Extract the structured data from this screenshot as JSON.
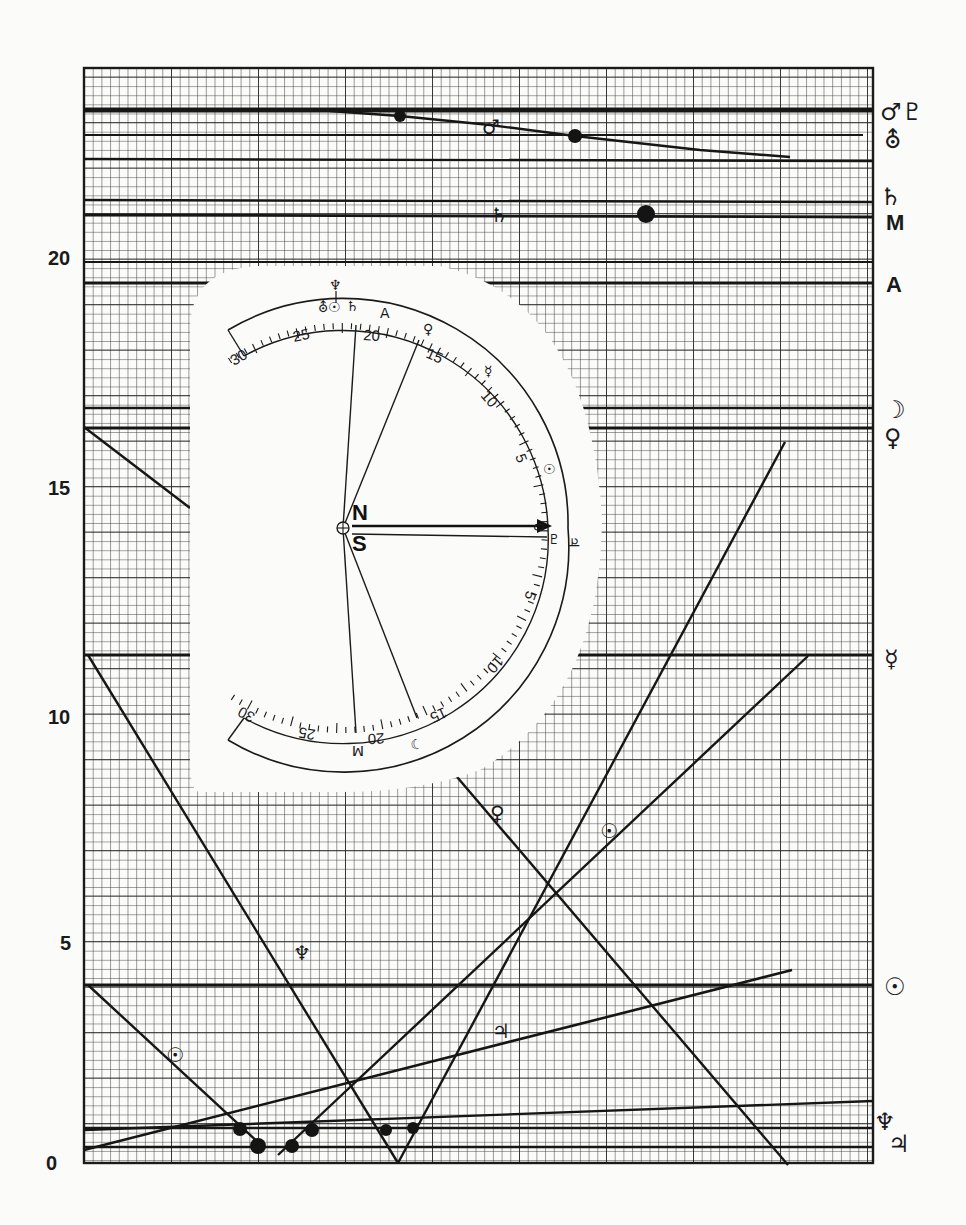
{
  "figure": {
    "colors": {
      "paper": "#fbfbfa",
      "ink": "#1a1a1a",
      "grid_minor": "#3a3a3a",
      "grid_major": "#1f1f1f"
    }
  },
  "y_axis": {
    "ticks": [
      {
        "value": 0,
        "label": "0"
      },
      {
        "value": 5,
        "label": "5"
      },
      {
        "value": 10,
        "label": "10"
      },
      {
        "value": 15,
        "label": "15"
      },
      {
        "value": 20,
        "label": "20"
      }
    ],
    "range": [
      0,
      24.2
    ]
  },
  "right_labels": [
    {
      "name": "mars-pluto-label",
      "text": "♂♇",
      "y_value": 23.3
    },
    {
      "name": "uranus-label",
      "text": "⛢",
      "y_value": 22.5
    },
    {
      "name": "saturn-label",
      "text": "♄",
      "y_value": 21.2
    },
    {
      "name": "midheaven-label",
      "text": "M",
      "y_value": 20.5
    },
    {
      "name": "ascendant-label",
      "text": "A",
      "y_value": 19.5
    },
    {
      "name": "moon-label",
      "text": "☽",
      "y_value": 16.7
    },
    {
      "name": "venus-label",
      "text": "♀",
      "y_value": 16.1
    },
    {
      "name": "mercury-label",
      "text": "☿",
      "y_value": 11.3
    },
    {
      "name": "sun-label",
      "text": "☉",
      "y_value": 3.9
    },
    {
      "name": "neptune-label",
      "text": "♆",
      "y_value": 0.9
    },
    {
      "name": "jupiter-label",
      "text": "♃",
      "y_value": 0.4
    }
  ],
  "inline_labels": [
    {
      "name": "mars-line-label",
      "text": "♂",
      "x": 496,
      "y": 128
    },
    {
      "name": "saturn-line-label",
      "text": "♄",
      "x": 500,
      "y": 218
    },
    {
      "name": "venus-line-label",
      "text": "♀",
      "x": 500,
      "y": 815
    },
    {
      "name": "sun-line-label",
      "text": "☉",
      "x": 610,
      "y": 836
    },
    {
      "name": "neptune-line-label",
      "text": "♆",
      "x": 303,
      "y": 955
    },
    {
      "name": "jupiter-line-label",
      "text": "♃",
      "x": 503,
      "y": 1032
    },
    {
      "name": "sun-left-line-label",
      "text": "☉",
      "x": 176,
      "y": 1056
    }
  ],
  "dial": {
    "center_label_north": "N",
    "center_label_south": "S",
    "center_symbol": "⊕",
    "upper_scale": [
      "30",
      "25",
      "20",
      "15",
      "10",
      "5",
      "0"
    ],
    "lower_scale": [
      "5",
      "10",
      "15",
      "20",
      "25",
      "30"
    ],
    "upper_markers": [
      {
        "name": "neptune-mark",
        "text": "♆",
        "deg": 22.5
      },
      {
        "name": "uranus-mark",
        "text": "⛢",
        "deg": 22.8
      },
      {
        "name": "sun-mark-small",
        "text": "☉",
        "deg": 22.3
      },
      {
        "name": "saturn-mark",
        "text": "♄",
        "deg": 21.6
      },
      {
        "name": "ascendant-mark",
        "text": "A",
        "deg": 19.6
      },
      {
        "name": "venus-mark",
        "text": "♀",
        "deg": 15.8
      },
      {
        "name": "mercury-mark",
        "text": "☿",
        "deg": 11.6
      },
      {
        "name": "sun-mark",
        "text": "☉",
        "deg": 4.0
      },
      {
        "name": "jupiter-mark",
        "text": "♃",
        "deg": 0
      }
    ],
    "lower_markers": [
      {
        "name": "moon-mark",
        "text": "☽",
        "deg": 16.4
      },
      {
        "name": "midheaven-mark",
        "text": "M",
        "deg": 20.3
      },
      {
        "name": "pluto-mark",
        "text": "♇",
        "deg": 0.8
      }
    ],
    "top_symbol": "♆"
  }
}
